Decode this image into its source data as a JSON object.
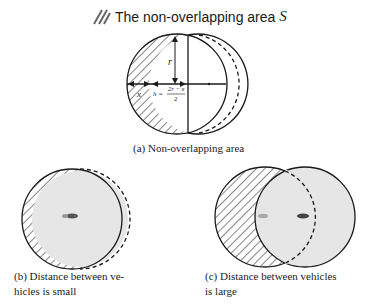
{
  "legend": {
    "icon": "hatch-icon",
    "label": "The non-overlapping area",
    "symbol": "S"
  },
  "panel_a": {
    "labels": {
      "r": "r",
      "x": "x",
      "h": "h =",
      "h_num": "2r − x",
      "h_den": "2"
    },
    "caption": "(a) Non-overlapping area"
  },
  "panel_b": {
    "caption_line1": "(b) Distance between ve-",
    "caption_line2": "hicles is small"
  },
  "panel_c": {
    "caption_line1": "(c) Distance between vehicles",
    "caption_line2": "is large"
  },
  "colors": {
    "stroke": "#1a1a1a",
    "fill_overlap": "#e6e6e6",
    "hatch": "#333333"
  }
}
